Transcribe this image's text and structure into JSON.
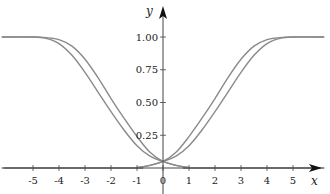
{
  "chart_data": {
    "type": "line",
    "title": "",
    "xlabel": "x",
    "ylabel": "y",
    "xlim": [
      -6.2,
      6.2
    ],
    "ylim": [
      0,
      1.1
    ],
    "grid": false,
    "legend": null,
    "x_ticks": [
      -5,
      -4,
      -3,
      -2,
      -1,
      0,
      1,
      2,
      3,
      4,
      5
    ],
    "x_tick_labels": [
      "-5",
      "-4",
      "-3",
      "-2",
      "-1",
      "0",
      "1",
      "2",
      "3",
      "4",
      "5"
    ],
    "y_ticks": [
      0.25,
      0.5,
      0.75,
      1.0
    ],
    "y_tick_labels": [
      "0.25",
      "0.50",
      "0.75",
      "1.00"
    ],
    "line_color": "#8a8a8a",
    "series": [
      {
        "name": "rising-inner",
        "x": [
          -6.2,
          -1.2,
          -1.0,
          -0.5,
          0,
          0.5,
          1,
          1.5,
          2,
          2.5,
          3,
          3.5,
          4,
          4.5,
          5,
          6.2
        ],
        "y": [
          0,
          0,
          0.003,
          0.02,
          0.05,
          0.12,
          0.24,
          0.38,
          0.53,
          0.69,
          0.83,
          0.93,
          0.98,
          0.995,
          1.0,
          1.0
        ]
      },
      {
        "name": "rising-outer",
        "x": [
          -6.2,
          -1.2,
          -1.0,
          -0.5,
          0,
          0.5,
          1,
          1.5,
          2,
          2.5,
          3,
          3.5,
          4,
          4.5,
          5,
          6.2
        ],
        "y": [
          0,
          0,
          0.003,
          0.02,
          0.05,
          0.09,
          0.17,
          0.29,
          0.43,
          0.58,
          0.73,
          0.86,
          0.95,
          0.99,
          1.0,
          1.0
        ]
      },
      {
        "name": "falling-inner",
        "x": [
          -6.2,
          -5,
          -4.5,
          -4,
          -3.5,
          -3,
          -2.5,
          -2,
          -1.5,
          -1,
          -0.5,
          0,
          0.5,
          1,
          1.2,
          6.2
        ],
        "y": [
          1.0,
          1.0,
          0.995,
          0.98,
          0.93,
          0.83,
          0.69,
          0.53,
          0.38,
          0.24,
          0.12,
          0.05,
          0.02,
          0.003,
          0,
          0
        ]
      },
      {
        "name": "falling-outer",
        "x": [
          -6.2,
          -5,
          -4.5,
          -4,
          -3.5,
          -3,
          -2.5,
          -2,
          -1.5,
          -1,
          -0.5,
          0,
          0.5,
          1,
          1.2,
          6.2
        ],
        "y": [
          1.0,
          1.0,
          0.99,
          0.95,
          0.86,
          0.73,
          0.58,
          0.43,
          0.29,
          0.17,
          0.09,
          0.05,
          0.02,
          0.003,
          0,
          0
        ]
      }
    ]
  }
}
